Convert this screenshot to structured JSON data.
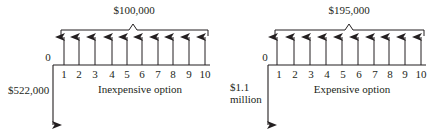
{
  "diagrams": [
    {
      "id": "inexpensive",
      "caption": "Inexpensive option",
      "origin_label": "0",
      "initial_outflow_label": [
        "$522,000"
      ],
      "annual_inflow_label": "$100,000",
      "periods": [
        "1",
        "2",
        "3",
        "4",
        "5",
        "6",
        "7",
        "8",
        "9",
        "10"
      ],
      "colors": {
        "ink": "#231f20",
        "background": "#ffffff"
      }
    },
    {
      "id": "expensive",
      "caption": "Expensive option",
      "origin_label": "0",
      "initial_outflow_label": [
        "$1.1",
        "million"
      ],
      "annual_inflow_label": "$195,000",
      "periods": [
        "1",
        "2",
        "3",
        "4",
        "5",
        "6",
        "7",
        "8",
        "9",
        "10"
      ],
      "colors": {
        "ink": "#231f20",
        "background": "#ffffff"
      }
    }
  ]
}
